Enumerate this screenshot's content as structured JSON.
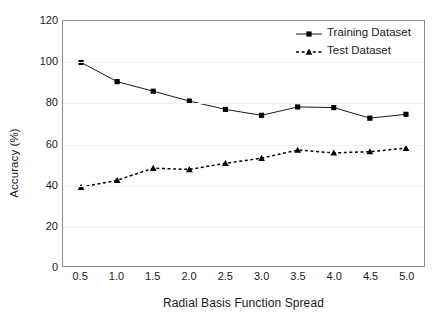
{
  "chart_data": {
    "type": "line",
    "title": "",
    "xlabel": "Radial Basis Function Spread",
    "ylabel": "Accuracy (%)",
    "categories": [
      "0.5",
      "1.0",
      "1.5",
      "2.0",
      "2.5",
      "3.0",
      "3.5",
      "4.0",
      "4.5",
      "5.0"
    ],
    "x": [
      0.5,
      1.0,
      1.5,
      2.0,
      2.5,
      3.0,
      3.5,
      4.0,
      4.5,
      5.0
    ],
    "xlim": [
      0.25,
      5.25
    ],
    "ylim": [
      0,
      120
    ],
    "y_ticks": [
      0,
      20,
      40,
      60,
      80,
      100,
      120
    ],
    "y_tick_labels": [
      "0",
      "20",
      "40",
      "60",
      "80",
      "100",
      "120"
    ],
    "grid": true,
    "legend_position": "top-right",
    "series": [
      {
        "name": "Training Dataset",
        "marker": "square",
        "line_style": "solid",
        "color": "#000000",
        "values": [
          99.7,
          90.3,
          85.6,
          80.8,
          76.7,
          73.8,
          77.9,
          77.6,
          72.4,
          74.3
        ]
      },
      {
        "name": "Test Dataset",
        "marker": "triangle",
        "line_style": "dashed",
        "color": "#000000",
        "values": [
          38.6,
          42.0,
          47.9,
          47.3,
          50.3,
          52.8,
          56.8,
          55.4,
          56.0,
          57.7
        ]
      }
    ]
  },
  "legend": {
    "entries": [
      {
        "label": "Training Dataset"
      },
      {
        "label": "Test Dataset"
      }
    ]
  },
  "axes": {
    "y_title": "Accuracy (%)",
    "x_title": "Radial Basis Function Spread"
  }
}
